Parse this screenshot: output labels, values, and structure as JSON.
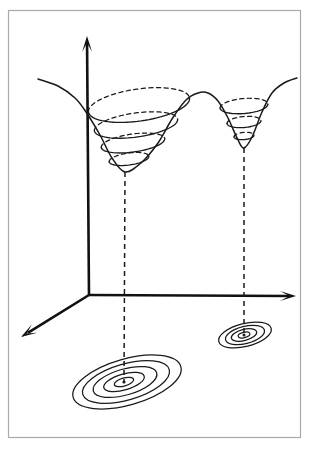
{
  "figure": {
    "kind": "3d-surface-with-contour-projection",
    "background_color": "#ffffff",
    "ink_color": "#1a1a1a",
    "frame_color": "#a9a9a9",
    "width": 316,
    "height": 451,
    "title": "",
    "caption": ""
  },
  "frame": {
    "x": 8,
    "y": 10,
    "width": 292,
    "height": 427,
    "stroke": "#a9a9a9"
  },
  "axes": {
    "origin": {
      "x": 89,
      "y": 295
    },
    "vertical_axis": {
      "label": "",
      "from": {
        "x": 89,
        "y": 295
      },
      "to": {
        "x": 87,
        "y": 36
      },
      "arrow": "up"
    },
    "horizontal_axis": {
      "label": "",
      "from": {
        "x": 89,
        "y": 295
      },
      "to": {
        "x": 296,
        "y": 296
      },
      "arrow": "right"
    },
    "depth_axis": {
      "label": "",
      "from": {
        "x": 89,
        "y": 295
      },
      "to": {
        "x": 21,
        "y": 337
      },
      "arrow": "down-left"
    },
    "stroke": "#111111",
    "stroke_width": 2.6
  },
  "chart_data": {
    "type": "line",
    "title": "",
    "xlabel": "",
    "ylabel": "",
    "surface_profile": {
      "points": [
        {
          "x": 38,
          "y": 79
        },
        {
          "x": 58,
          "y": 86
        },
        {
          "x": 75,
          "y": 98
        },
        {
          "x": 86,
          "y": 112
        },
        {
          "x": 100,
          "y": 135
        },
        {
          "x": 112,
          "y": 158
        },
        {
          "x": 125,
          "y": 172
        },
        {
          "x": 141,
          "y": 163
        },
        {
          "x": 158,
          "y": 143
        },
        {
          "x": 172,
          "y": 119
        },
        {
          "x": 186,
          "y": 100
        },
        {
          "x": 198,
          "y": 93
        },
        {
          "x": 208,
          "y": 93
        },
        {
          "x": 218,
          "y": 101
        },
        {
          "x": 228,
          "y": 118
        },
        {
          "x": 238,
          "y": 140
        },
        {
          "x": 244,
          "y": 148
        },
        {
          "x": 252,
          "y": 137
        },
        {
          "x": 262,
          "y": 112
        },
        {
          "x": 272,
          "y": 93
        },
        {
          "x": 284,
          "y": 83
        },
        {
          "x": 297,
          "y": 78
        }
      ]
    },
    "wells": [
      {
        "name": "left-well",
        "kind": "wide-shallow",
        "minimum_on_surface": {
          "x": 125,
          "y": 172
        },
        "level_sets": [
          {
            "cx": 139,
            "cy": 105,
            "rx": 51,
            "ry": 16,
            "rotation": -8
          },
          {
            "cx": 136,
            "cy": 125,
            "rx": 42,
            "ry": 12,
            "rotation": -8
          },
          {
            "cx": 133,
            "cy": 143,
            "rx": 32,
            "ry": 9,
            "rotation": -8
          },
          {
            "cx": 129,
            "cy": 159,
            "rx": 20,
            "ry": 6,
            "rotation": -8
          }
        ],
        "projection": {
          "center": {
            "x": 124,
            "y": 382
          },
          "drop_line": {
            "from": {
              "x": 125,
              "y": 172
            },
            "to": {
              "x": 124,
              "y": 382
            }
          },
          "contours": [
            {
              "cx": 124,
              "cy": 382,
              "rx": 10,
              "ry": 4,
              "rotation": -16
            },
            {
              "cx": 124,
              "cy": 382,
              "rx": 21,
              "ry": 8,
              "rotation": -16
            },
            {
              "cx": 125,
              "cy": 382,
              "rx": 33,
              "ry": 13,
              "rotation": -16
            },
            {
              "cx": 126,
              "cy": 382,
              "rx": 45,
              "ry": 18,
              "rotation": -16
            },
            {
              "cx": 127,
              "cy": 382,
              "rx": 56,
              "ry": 23,
              "rotation": -16
            }
          ]
        }
      },
      {
        "name": "right-well",
        "kind": "narrow-deep",
        "minimum_on_surface": {
          "x": 244,
          "y": 148
        },
        "level_sets": [
          {
            "cx": 244,
            "cy": 106,
            "rx": 24,
            "ry": 7.5,
            "rotation": -5
          },
          {
            "cx": 244,
            "cy": 122,
            "rx": 17,
            "ry": 5.5,
            "rotation": -5
          },
          {
            "cx": 244,
            "cy": 136,
            "rx": 10,
            "ry": 3.6,
            "rotation": -5
          }
        ],
        "projection": {
          "center": {
            "x": 244,
            "y": 335
          },
          "drop_line": {
            "from": {
              "x": 244,
              "y": 148
            },
            "to": {
              "x": 244,
              "y": 335
            }
          },
          "contours": [
            {
              "cx": 244,
              "cy": 335,
              "rx": 6,
              "ry": 2.6,
              "rotation": -14
            },
            {
              "cx": 244,
              "cy": 335,
              "rx": 13,
              "ry": 5.6,
              "rotation": -14
            },
            {
              "cx": 245,
              "cy": 335,
              "rx": 20,
              "ry": 8.6,
              "rotation": -14
            },
            {
              "cx": 245,
              "cy": 335,
              "rx": 27,
              "ry": 11.5,
              "rotation": -14
            }
          ]
        }
      }
    ],
    "saddle_hump": {
      "x": 204,
      "y": 93
    },
    "grid": false,
    "legend": null
  }
}
